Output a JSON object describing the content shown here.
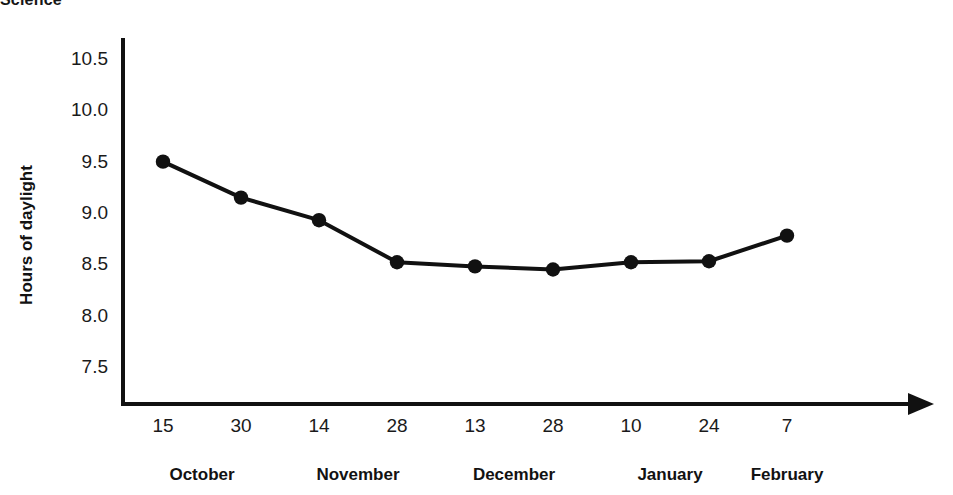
{
  "figure": {
    "source_title": "Science",
    "background_color": "#ffffff",
    "ink_color": "#111111"
  },
  "chart_data": {
    "type": "line",
    "title": "Science",
    "xlabel": "",
    "ylabel": "Hours of daylight",
    "ylim": [
      7.2,
      10.75
    ],
    "yticks": [
      10.5,
      10.0,
      9.5,
      9.0,
      8.5,
      8.0,
      7.5
    ],
    "ytick_labels": [
      "10.5",
      "10.0",
      "9.5",
      "9.0",
      "8.5",
      "8.0",
      "7.5"
    ],
    "grid": false,
    "legend": null,
    "marker": "filled-circle",
    "marker_color": "#111111",
    "line_color": "#111111",
    "x_axis_arrow": true,
    "categories": [
      "15",
      "30",
      "14",
      "28",
      "13",
      "28",
      "10",
      "24",
      "7"
    ],
    "x_group_labels": [
      "October",
      "November",
      "December",
      "January",
      "February"
    ],
    "points": [
      {
        "day": "15",
        "month": "October",
        "value": 9.5
      },
      {
        "day": "30",
        "month": "October",
        "value": 9.15
      },
      {
        "day": "14",
        "month": "November",
        "value": 8.93
      },
      {
        "day": "28",
        "month": "November",
        "value": 8.52
      },
      {
        "day": "13",
        "month": "December",
        "value": 8.48
      },
      {
        "day": "28",
        "month": "December",
        "value": 8.45
      },
      {
        "day": "10",
        "month": "January",
        "value": 8.52
      },
      {
        "day": "24",
        "month": "January",
        "value": 8.53
      },
      {
        "day": "7",
        "month": "February",
        "value": 8.78
      }
    ],
    "values": [
      9.5,
      9.15,
      8.93,
      8.52,
      8.48,
      8.45,
      8.52,
      8.53,
      8.78
    ]
  }
}
